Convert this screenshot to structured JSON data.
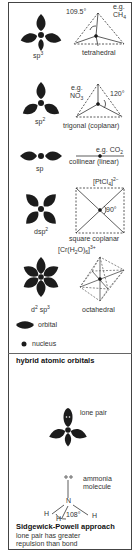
{
  "rows": [
    {
      "hybrid": "sp",
      "hybrid_sup": "3",
      "geometry": "tetrahedral",
      "example_prefix": "e.g.",
      "example": "CH",
      "example_sub": "4",
      "angle": "109.5°"
    },
    {
      "hybrid": "sp",
      "hybrid_sup": "2",
      "geometry": "trigonal (coplanar)",
      "example_prefix": "e.g.",
      "example": "NO",
      "example_sub": "3",
      "angle": "120°"
    },
    {
      "hybrid": "sp",
      "hybrid_sup": "",
      "geometry": "collinear (linear)",
      "example_prefix": "e.g.",
      "example": "CO",
      "example_sub": "2",
      "angle": ""
    },
    {
      "hybrid": "dsp",
      "hybrid_sup": "2",
      "geometry": "square coplanar",
      "example": "[PtCl",
      "example_sub": "4",
      "example_suffix": "]",
      "example_sup": "2−",
      "angle": "90°"
    },
    {
      "hybrid": "d",
      "hybrid_sup": "2",
      "hybrid_tail": "sp",
      "hybrid_tail_sup": "3",
      "geometry": "octahedral",
      "example": "[Cr(H",
      "example_sub": "2",
      "example_mid": "O)",
      "example_sub2": "6",
      "example_suffix": "]",
      "example_sup": "3+",
      "angle": ""
    }
  ],
  "legend": {
    "orbital": "orbital",
    "nucleus": "nucleus",
    "title": "hybrid atomic orbitals"
  },
  "sidgewick": {
    "lone_pair": "lone pair",
    "molecule_line1": "ammonia",
    "molecule_line2": "molecule",
    "atom_n": "N",
    "atom_h": "H",
    "angle": "108°",
    "title": "Sidgewick-Powell approach",
    "desc_line1": "lone pair has greater",
    "desc_line2": "repulsion than bond"
  },
  "colors": {
    "lobe": "#1c1c1c",
    "line": "#333333",
    "dash": "#555555"
  }
}
